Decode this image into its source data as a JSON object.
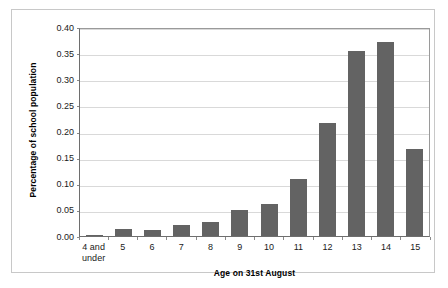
{
  "chart_data": {
    "type": "bar",
    "title": "",
    "xlabel": "Age on 31st August",
    "ylabel": "Percentage of school population",
    "categories": [
      "4 and under",
      "5",
      "6",
      "7",
      "8",
      "9",
      "10",
      "11",
      "12",
      "13",
      "14",
      "15"
    ],
    "values": [
      0.002,
      0.013,
      0.012,
      0.022,
      0.027,
      0.05,
      0.061,
      0.11,
      0.216,
      0.354,
      0.372,
      0.166
    ],
    "series": [
      {
        "name": "Percentage of school population",
        "values": [
          0.002,
          0.013,
          0.012,
          0.022,
          0.027,
          0.05,
          0.061,
          0.11,
          0.216,
          0.354,
          0.372,
          0.166
        ]
      }
    ],
    "ylim": [
      0.0,
      0.4
    ],
    "ytick_values": [
      0.4,
      0.35,
      0.3,
      0.25,
      0.2,
      0.15,
      0.1,
      0.05,
      0.0
    ],
    "ytick_labels": [
      "0.40",
      "0.35",
      "0.30",
      "0.25",
      "0.20",
      "0.15",
      "0.10",
      "0.05",
      "0.00"
    ],
    "grid": true,
    "legend": false,
    "legend_position": "none",
    "bar_color": "#636363",
    "gridline_color": "#d9d9d9",
    "axis_color": "#6e6e6e",
    "plot_background": "#ffffff"
  }
}
